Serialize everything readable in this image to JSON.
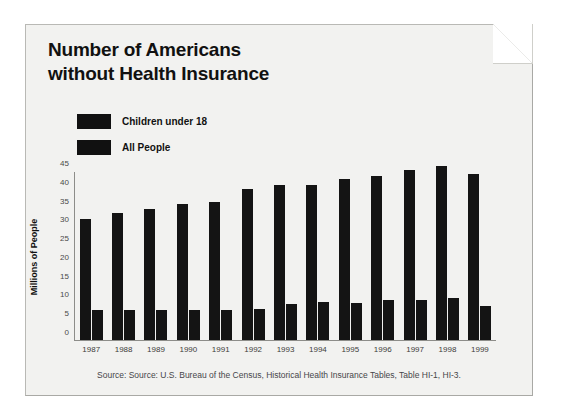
{
  "figure": {
    "title_line_1": "Number of Americans",
    "title_line_2": "without Health Insurance",
    "source_note": "Source: Source: U.S. Bureau of the Census, Historical Health Insurance Tables, Table HI-1, HI-3.",
    "paper_color": "#f2f2f0",
    "bar_color": "#141414",
    "axis_color": "#8d8d89"
  },
  "legend": {
    "position": "top-left-inside",
    "entries": [
      {
        "label": "Children under 18",
        "color": "#141414"
      },
      {
        "label": "All People",
        "color": "#141414"
      }
    ]
  },
  "chart_data": {
    "type": "bar",
    "title": "Number of Americans without Health Insurance",
    "xlabel": "",
    "ylabel": "Millions of People",
    "ylim": [
      0,
      45
    ],
    "yticks": [
      0,
      5,
      10,
      15,
      20,
      25,
      30,
      35,
      40,
      45
    ],
    "ytick_labels": [
      "0",
      "5",
      "10",
      "15",
      "20",
      "25",
      "30",
      "35",
      "40",
      "45"
    ],
    "grid": false,
    "legend_position": "upper-left",
    "categories": [
      "1987",
      "1988",
      "1989",
      "1990",
      "1991",
      "1992",
      "1993",
      "1994",
      "1995",
      "1996",
      "1997",
      "1998",
      "1999"
    ],
    "series": [
      {
        "name": "All People",
        "color": "#141414",
        "values": [
          32.5,
          34.0,
          35.0,
          36.5,
          37.0,
          40.5,
          41.5,
          41.5,
          43.0,
          44.0,
          45.5,
          46.5,
          44.5
        ]
      },
      {
        "name": "Children under 18",
        "color": "#141414",
        "values": [
          8.0,
          8.0,
          8.0,
          8.0,
          8.0,
          8.4,
          9.6,
          10.1,
          9.9,
          10.6,
          10.8,
          11.2,
          9.0
        ]
      }
    ]
  }
}
